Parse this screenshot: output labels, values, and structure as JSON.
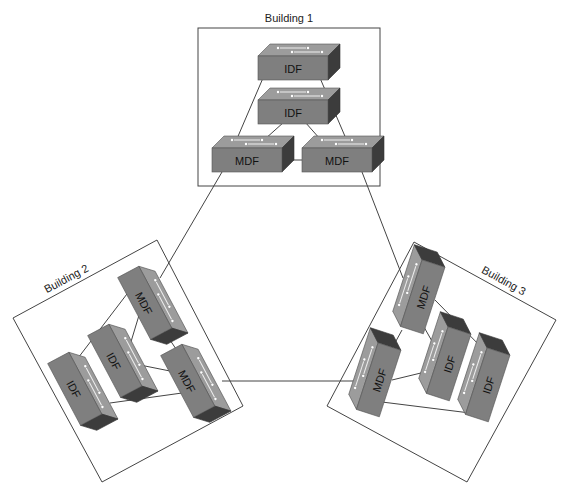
{
  "buildings": [
    {
      "name": "Building 1",
      "switches": [
        {
          "id": "b1-idf1",
          "label": "IDF"
        },
        {
          "id": "b1-idf2",
          "label": "IDF"
        },
        {
          "id": "b1-mdf1",
          "label": "MDF"
        },
        {
          "id": "b1-mdf2",
          "label": "MDF"
        }
      ]
    },
    {
      "name": "Building 2",
      "switches": [
        {
          "id": "b2-mdf1",
          "label": "MDF"
        },
        {
          "id": "b2-idf1",
          "label": "IDF"
        },
        {
          "id": "b2-idf2",
          "label": "IDF"
        },
        {
          "id": "b2-mdf2",
          "label": "MDF"
        }
      ]
    },
    {
      "name": "Building 3",
      "switches": [
        {
          "id": "b3-mdf1",
          "label": "MDF"
        },
        {
          "id": "b3-mdf2",
          "label": "MDF"
        },
        {
          "id": "b3-idf1",
          "label": "IDF"
        },
        {
          "id": "b3-idf2",
          "label": "IDF"
        }
      ]
    }
  ],
  "colors": {
    "switch_front": "#808080",
    "switch_top": "#9a9a9a",
    "switch_side": "#3a3a3a",
    "line": "#444444"
  }
}
